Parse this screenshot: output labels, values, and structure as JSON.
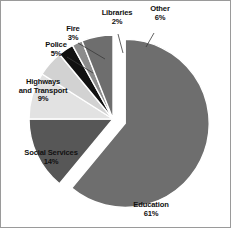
{
  "chart_data": {
    "type": "pie",
    "title": "",
    "subtitle": "",
    "xlabel": "",
    "ylabel": "",
    "legend_position": "none",
    "labels_position": "outside-with-leader-lines",
    "grid": false,
    "units": "percent",
    "total": 100,
    "exploded_slice": "Education",
    "categories": [
      "Education",
      "Social Services",
      "Highways and Transport",
      "Police",
      "Fire",
      "Libraries",
      "Other"
    ],
    "values": [
      61,
      14,
      9,
      5,
      3,
      2,
      6
    ],
    "slices": [
      {
        "name": "Education",
        "label": "Education",
        "value": 61,
        "value_text": "61%",
        "color": "#6e6e6e",
        "exploded": true
      },
      {
        "name": "Social Services",
        "label": "Social Services",
        "value": 14,
        "value_text": "14%",
        "color": "#575757",
        "exploded": false
      },
      {
        "name": "Highways and Transport",
        "label_line1": "Highways",
        "label_line2": "and Transport",
        "value": 9,
        "value_text": "9%",
        "color": "#e2e2e2",
        "exploded": false
      },
      {
        "name": "Police",
        "label": "Police",
        "value": 5,
        "value_text": "5%",
        "color": "#d2d2d2",
        "exploded": false
      },
      {
        "name": "Fire",
        "label": "Fire",
        "value": 3,
        "value_text": "3%",
        "color": "#111111",
        "exploded": false
      },
      {
        "name": "Libraries",
        "label": "Libraries",
        "value": 2,
        "value_text": "2%",
        "color": "#8c8c8c",
        "exploded": false
      },
      {
        "name": "Other",
        "label": "Other",
        "value": 6,
        "value_text": "6%",
        "color": "#6e6e6e",
        "exploded": false
      }
    ]
  },
  "labels": {
    "education": {
      "name": "Education",
      "pct": "61%"
    },
    "social_services": {
      "name": "Social Services",
      "pct": "14%"
    },
    "highways": {
      "line1": "Highways",
      "line2": "and Transport",
      "pct": "9%"
    },
    "police": {
      "name": "Police",
      "pct": "5%"
    },
    "fire": {
      "name": "Fire",
      "pct": "3%"
    },
    "libraries": {
      "name": "Libraries",
      "pct": "2%"
    },
    "other": {
      "name": "Other",
      "pct": "6%"
    }
  },
  "colors": {
    "background": "#ffffff",
    "frame_border": "#9a9a9a",
    "text": "#111111",
    "leader_line": "#3a3a3a",
    "slice_outline": "#ffffff"
  }
}
